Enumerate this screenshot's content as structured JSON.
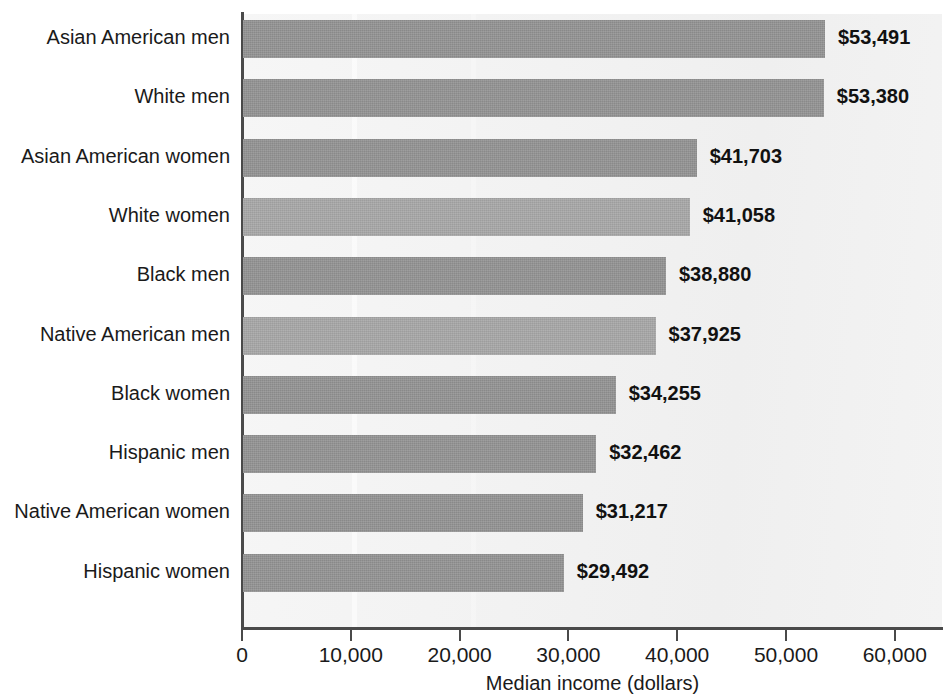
{
  "chart_data": {
    "type": "bar",
    "orientation": "horizontal",
    "title": "",
    "xlabel": "Median income (dollars)",
    "ylabel": "",
    "xlim": [
      0,
      63000
    ],
    "xticks": [
      0,
      10000,
      20000,
      30000,
      40000,
      50000,
      60000
    ],
    "xticklabels": [
      "0",
      "10,000",
      "20,000",
      "30,000",
      "40,000",
      "50,000",
      "60,000"
    ],
    "grid": false,
    "legend": null,
    "categories": [
      "Asian American men",
      "White men",
      "Asian American women",
      "White women",
      "Black men",
      "Native American men",
      "Black women",
      "Hispanic men",
      "Native American women",
      "Hispanic women"
    ],
    "values": [
      53491,
      53380,
      41703,
      41058,
      38880,
      37925,
      34255,
      32462,
      31217,
      29492
    ],
    "value_labels": [
      "$53,491",
      "$53,380",
      "$41,703",
      "$41,058",
      "$38,880",
      "$37,925",
      "$34,255",
      "$32,462",
      "$31,217",
      "$29,492"
    ],
    "bar_shades": [
      "dark",
      "dark",
      "dark",
      "light",
      "dark",
      "light",
      "dark",
      "dark",
      "dark",
      "dark"
    ]
  },
  "colors": {
    "bar_dark": "#949494",
    "bar_light": "#a8a8a8",
    "plot_background": "#f4f4f4",
    "axis": "#4a4a4a",
    "text": "#1a1a1a",
    "value_text": "#111111"
  }
}
